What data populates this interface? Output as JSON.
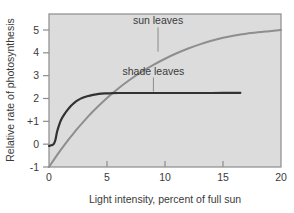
{
  "chart_data": {
    "type": "line",
    "title": "",
    "xlabel": "Light intensity, percent of full sun",
    "ylabel": "Relative rate of photosynthesis",
    "xlim": [
      0,
      20
    ],
    "ylim": [
      -1,
      5.7
    ],
    "xticks": [
      0,
      5,
      10,
      15,
      20
    ],
    "xticklabels": [
      "0",
      "5",
      "10",
      "15",
      "20"
    ],
    "yticks": [
      -1,
      0,
      1,
      2,
      3,
      4,
      5
    ],
    "yticklabels": [
      "-1",
      "0",
      "+1",
      "2",
      "3",
      "4",
      "5"
    ],
    "grid": false,
    "legend": "annotations-on-plot",
    "plot_bgcolor": "#dcdcdc",
    "frame_color": "#8c8c8c",
    "series": [
      {
        "name": "sun leaves",
        "color": "#8e8e8e",
        "linewidth": 2.0,
        "annotation": "sun leaves",
        "annotation_x": 9.4,
        "annotation_y": 5.25,
        "leader_to_x": 9.4,
        "leader_to_y": 4.05,
        "x": [
          0,
          0.5,
          1,
          1.5,
          2,
          2.5,
          3,
          3.5,
          4,
          5,
          6,
          7,
          8,
          9,
          10,
          11,
          12,
          13,
          14,
          15,
          16,
          17,
          18,
          19,
          20
        ],
        "y": [
          -1.0,
          -0.62,
          -0.26,
          0.08,
          0.4,
          0.71,
          1.0,
          1.28,
          1.54,
          2.02,
          2.45,
          2.83,
          3.17,
          3.47,
          3.74,
          3.98,
          4.19,
          4.37,
          4.53,
          4.66,
          4.76,
          4.84,
          4.9,
          4.95,
          5.0
        ]
      },
      {
        "name": "shade leaves",
        "color": "#323232",
        "linewidth": 2.2,
        "annotation": "shade leaves",
        "annotation_x": 9.0,
        "annotation_y": 3.05,
        "leader_to_x": 9.0,
        "leader_to_y": 2.3,
        "x": [
          0,
          0.2,
          0.4,
          0.55,
          0.7,
          0.9,
          1.1,
          1.35,
          1.6,
          1.9,
          2.2,
          2.5,
          2.9,
          3.3,
          3.8,
          4.3,
          4.8,
          5.3,
          6.0,
          7.0,
          8.5,
          10.0,
          12.0,
          14.0,
          16.5
        ],
        "y": [
          -0.08,
          -0.05,
          0.0,
          0.18,
          0.55,
          0.88,
          1.12,
          1.33,
          1.5,
          1.68,
          1.82,
          1.93,
          2.03,
          2.1,
          2.16,
          2.2,
          2.22,
          2.23,
          2.24,
          2.24,
          2.24,
          2.24,
          2.24,
          2.24,
          2.25
        ]
      }
    ]
  },
  "axis": {
    "x_title": "Light intensity, percent of full sun",
    "y_title": "Relative rate of photosynthesis"
  },
  "annotations": {
    "sun": "sun leaves",
    "shade": "shade leaves"
  }
}
